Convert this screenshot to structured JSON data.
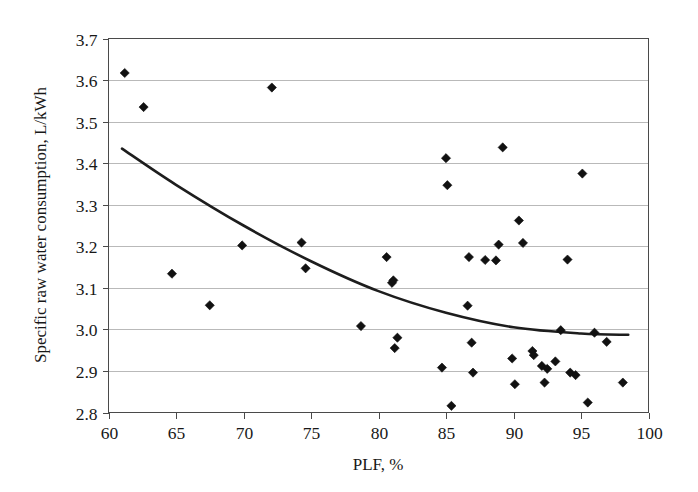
{
  "chart_data": {
    "type": "scatter",
    "title": "",
    "xlabel": "PLF, %",
    "ylabel": "Specific raw water consumption, L/kWh",
    "xlim": [
      60,
      100
    ],
    "ylim": [
      2.8,
      3.7
    ],
    "xticks": [
      60,
      65,
      70,
      75,
      80,
      85,
      90,
      95,
      100
    ],
    "yticks": [
      2.8,
      2.9,
      3.0,
      3.1,
      3.2,
      3.3,
      3.4,
      3.5,
      3.6,
      3.7
    ],
    "xtick_labels": [
      "60",
      "65",
      "70",
      "75",
      "80",
      "85",
      "90",
      "95",
      "100"
    ],
    "ytick_labels": [
      "2.8",
      "2.9",
      "3.0",
      "3.1",
      "3.2",
      "3.3",
      "3.4",
      "3.5",
      "3.6",
      "3.7"
    ],
    "grid": "horizontal",
    "legend": "none",
    "marker": "diamond",
    "marker_color": "#111111",
    "trendline_color": "#1d1d1d",
    "points": [
      {
        "x": 61.2,
        "y": 3.617
      },
      {
        "x": 62.6,
        "y": 3.535
      },
      {
        "x": 64.7,
        "y": 3.134
      },
      {
        "x": 67.5,
        "y": 3.058
      },
      {
        "x": 69.9,
        "y": 3.202
      },
      {
        "x": 72.1,
        "y": 3.582
      },
      {
        "x": 74.3,
        "y": 3.209
      },
      {
        "x": 74.6,
        "y": 3.147
      },
      {
        "x": 78.7,
        "y": 3.008
      },
      {
        "x": 80.6,
        "y": 3.174
      },
      {
        "x": 81.0,
        "y": 3.112
      },
      {
        "x": 81.1,
        "y": 3.118
      },
      {
        "x": 81.2,
        "y": 2.955
      },
      {
        "x": 81.4,
        "y": 2.98
      },
      {
        "x": 84.7,
        "y": 2.908
      },
      {
        "x": 85.0,
        "y": 3.412
      },
      {
        "x": 85.1,
        "y": 3.347
      },
      {
        "x": 85.4,
        "y": 2.816
      },
      {
        "x": 86.6,
        "y": 3.057
      },
      {
        "x": 86.7,
        "y": 3.174
      },
      {
        "x": 86.9,
        "y": 2.968
      },
      {
        "x": 87.0,
        "y": 2.896
      },
      {
        "x": 87.9,
        "y": 3.167
      },
      {
        "x": 88.7,
        "y": 3.166
      },
      {
        "x": 88.9,
        "y": 3.204
      },
      {
        "x": 89.2,
        "y": 3.438
      },
      {
        "x": 89.9,
        "y": 2.93
      },
      {
        "x": 90.1,
        "y": 2.868
      },
      {
        "x": 90.4,
        "y": 3.262
      },
      {
        "x": 90.7,
        "y": 3.208
      },
      {
        "x": 91.4,
        "y": 2.948
      },
      {
        "x": 91.5,
        "y": 2.938
      },
      {
        "x": 92.1,
        "y": 2.912
      },
      {
        "x": 92.3,
        "y": 2.872
      },
      {
        "x": 92.5,
        "y": 2.905
      },
      {
        "x": 93.1,
        "y": 2.923
      },
      {
        "x": 93.5,
        "y": 2.998
      },
      {
        "x": 94.0,
        "y": 3.168
      },
      {
        "x": 94.2,
        "y": 2.896
      },
      {
        "x": 94.6,
        "y": 2.89
      },
      {
        "x": 95.1,
        "y": 3.375
      },
      {
        "x": 95.5,
        "y": 2.824
      },
      {
        "x": 96.0,
        "y": 2.992
      },
      {
        "x": 96.9,
        "y": 2.97
      },
      {
        "x": 98.1,
        "y": 2.872
      }
    ],
    "trendline": {
      "shape": "quadratic",
      "x_start": 61.0,
      "x_end": 98.5,
      "y_start": 3.435,
      "y_end": 2.987,
      "samples": [
        {
          "x": 61.0,
          "y": 3.435
        },
        {
          "x": 65.0,
          "y": 3.348
        },
        {
          "x": 70.0,
          "y": 3.25
        },
        {
          "x": 75.0,
          "y": 3.164
        },
        {
          "x": 80.0,
          "y": 3.092
        },
        {
          "x": 85.0,
          "y": 3.04
        },
        {
          "x": 90.0,
          "y": 3.005
        },
        {
          "x": 95.0,
          "y": 2.99
        },
        {
          "x": 98.5,
          "y": 2.987
        }
      ]
    }
  }
}
